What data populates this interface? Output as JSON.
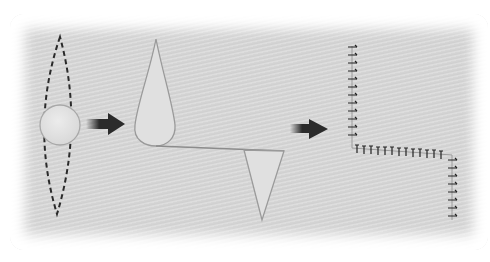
{
  "diagram": {
    "type": "surgical-closure-sequence",
    "steps": [
      {
        "id": "step-1",
        "description": "Elliptical (fusiform) excision outline around circular lesion"
      },
      {
        "id": "step-2",
        "description": "Excised wound edges: teardrop flap and triangular flap joined by incision line"
      },
      {
        "id": "step-3",
        "description": "Sutured Z-shaped closure line with stitches"
      }
    ],
    "arrows": [
      {
        "id": "arrow-1",
        "from": "step-1",
        "to": "step-2"
      },
      {
        "id": "arrow-2",
        "from": "step-2",
        "to": "step-3"
      }
    ],
    "colors": {
      "background_panel": "#d6d6d6",
      "dashed_outline": "#2a2a2a",
      "arrow": "#2b2b2b",
      "shape_fill": "#e2e2e2",
      "shape_stroke": "#9a9a9a",
      "suture": "#222222"
    },
    "stitch_counts": {
      "vertical_top": 12,
      "horizontal": 13,
      "vertical_bottom": 8
    }
  }
}
